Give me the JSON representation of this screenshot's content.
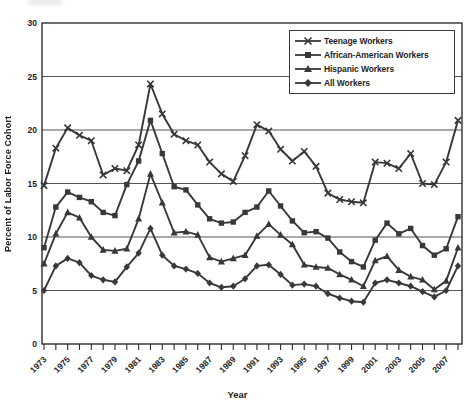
{
  "figure": {
    "y_axis_label": "Percent of Labor Force Cohort",
    "x_axis_label": "Year"
  },
  "chart_data": {
    "type": "line",
    "title": "",
    "xlabel": "Year",
    "ylabel": "Percent of Labor Force Cohort",
    "ylim": [
      0,
      30
    ],
    "yticks": [
      0,
      5,
      10,
      15,
      20,
      25,
      30
    ],
    "grid": "horizontal",
    "legend_position": "top-right-inside",
    "line_color": "#383838",
    "x": [
      1973,
      1974,
      1975,
      1976,
      1977,
      1978,
      1979,
      1980,
      1981,
      1982,
      1983,
      1984,
      1985,
      1986,
      1987,
      1988,
      1989,
      1990,
      1991,
      1992,
      1993,
      1994,
      1995,
      1996,
      1997,
      1998,
      1999,
      2000,
      2001,
      2002,
      2003,
      2004,
      2005,
      2006,
      2007,
      2008
    ],
    "xtick_labels": [
      "1973",
      "1975",
      "1977",
      "1979",
      "1981",
      "1983",
      "1985",
      "1987",
      "1989",
      "1991",
      "1993",
      "1995",
      "1997",
      "1999",
      "2001",
      "2003",
      "2005",
      "2007"
    ],
    "series": [
      {
        "name": "Teenage Workers",
        "marker": "x-cross",
        "values": [
          14.8,
          18.3,
          20.2,
          19.5,
          19.0,
          15.8,
          16.4,
          16.2,
          18.6,
          24.3,
          21.5,
          19.6,
          19.0,
          18.6,
          17.0,
          15.9,
          15.2,
          17.6,
          20.5,
          19.9,
          18.2,
          17.1,
          18.0,
          16.6,
          14.1,
          13.5,
          13.3,
          13.2,
          17.0,
          16.9,
          16.4,
          17.8,
          15.0,
          14.9,
          17.0,
          20.9
        ]
      },
      {
        "name": "African-American Workers",
        "marker": "square",
        "values": [
          9.0,
          12.8,
          14.2,
          13.7,
          13.3,
          12.3,
          12.0,
          14.9,
          17.1,
          20.9,
          17.8,
          14.7,
          14.4,
          13.0,
          11.7,
          11.3,
          11.4,
          12.3,
          12.8,
          14.3,
          12.9,
          11.5,
          10.4,
          10.5,
          9.9,
          8.6,
          7.7,
          7.2,
          9.7,
          11.3,
          10.3,
          10.8,
          9.2,
          8.3,
          8.9,
          11.9
        ]
      },
      {
        "name": "Hispanic Workers",
        "marker": "triangle",
        "values": [
          7.5,
          10.3,
          12.3,
          11.8,
          10.0,
          8.8,
          8.7,
          8.9,
          11.7,
          15.9,
          13.2,
          10.4,
          10.5,
          10.2,
          8.1,
          7.7,
          8.0,
          8.3,
          10.1,
          11.2,
          10.2,
          9.3,
          7.4,
          7.2,
          7.1,
          6.5,
          6.0,
          5.4,
          7.8,
          8.2,
          6.9,
          6.3,
          6.0,
          5.1,
          5.9,
          9.0
        ]
      },
      {
        "name": "All Workers",
        "marker": "diamond",
        "values": [
          5.0,
          7.3,
          8.0,
          7.6,
          6.4,
          6.0,
          5.8,
          7.2,
          8.5,
          10.8,
          8.3,
          7.3,
          7.0,
          6.6,
          5.7,
          5.3,
          5.4,
          6.1,
          7.3,
          7.4,
          6.5,
          5.5,
          5.6,
          5.4,
          4.7,
          4.3,
          4.0,
          3.9,
          5.7,
          6.0,
          5.7,
          5.4,
          4.9,
          4.4,
          5.0,
          7.3
        ]
      }
    ]
  }
}
